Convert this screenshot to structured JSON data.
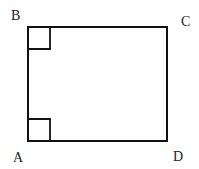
{
  "diagram": {
    "type": "rectangle",
    "stroke_color": "#111111",
    "vertices": [
      {
        "label": "B",
        "x": 28,
        "y": 27,
        "label_x": 11,
        "label_y": 20
      },
      {
        "label": "C",
        "x": 167,
        "y": 27,
        "label_x": 181,
        "label_y": 26
      },
      {
        "label": "A",
        "x": 28,
        "y": 141,
        "label_x": 13,
        "label_y": 162
      },
      {
        "label": "D",
        "x": 167,
        "y": 141,
        "label_x": 173,
        "label_y": 161
      }
    ],
    "right_angle_markers": [
      {
        "vertex": "B",
        "size": 22
      },
      {
        "vertex": "A",
        "size": 22
      }
    ]
  }
}
